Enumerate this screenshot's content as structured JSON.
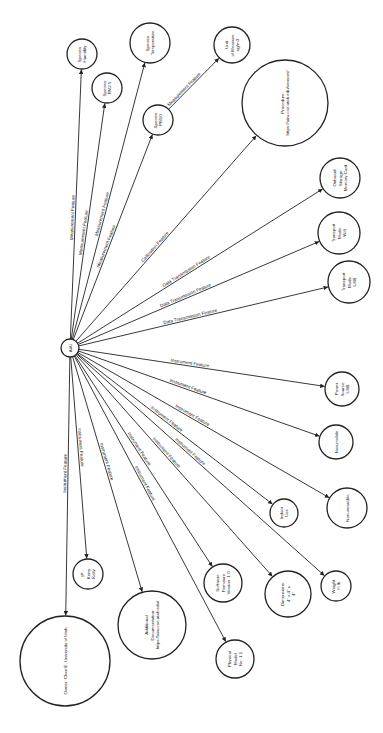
{
  "diagram": {
    "center": {
      "id": "airu",
      "label": "AirU",
      "x": 70,
      "y": 348,
      "r": 9
    },
    "nodes": [
      {
        "id": "species-humidity",
        "lines": [
          "Species:",
          "Humidity"
        ],
        "x": 82,
        "y": 54,
        "r": 15
      },
      {
        "id": "species-pm25",
        "lines": [
          "Species:",
          "PM2.5"
        ],
        "x": 107,
        "y": 88,
        "r": 15
      },
      {
        "id": "species-temperature",
        "lines": [
          "Species:",
          "Temperature"
        ],
        "x": 150,
        "y": 43,
        "r": 20
      },
      {
        "id": "species-pm10",
        "lines": [
          "Species:",
          "PM10"
        ],
        "x": 158,
        "y": 120,
        "r": 15
      },
      {
        "id": "unit-of-measure",
        "lines": [
          "Unit",
          "of Measure:",
          "ug/m3"
        ],
        "x": 232,
        "y": 45,
        "r": 18
      },
      {
        "id": "procedure",
        "lines": [
          "Procedure:",
          "https://airu.coe.utah.edu/sensors/"
        ],
        "x": 285,
        "y": 103,
        "r": 43
      },
      {
        "id": "onboard-storage",
        "lines": [
          "Onboard",
          "Storage:",
          "Memory Card"
        ],
        "x": 340,
        "y": 178,
        "r": 20
      },
      {
        "id": "transport-wifi",
        "lines": [
          "Transport",
          "Mode:",
          "Wifi"
        ],
        "x": 339,
        "y": 233,
        "r": 21
      },
      {
        "id": "transport-usb",
        "lines": [
          "Transport",
          "Mode:",
          "USB"
        ],
        "x": 349,
        "y": 282,
        "r": 21
      },
      {
        "id": "power-source",
        "lines": [
          "Power",
          "Source:",
          "USB"
        ],
        "x": 342,
        "y": 389,
        "r": 17
      },
      {
        "id": "non-mobile",
        "lines": [
          "Non-mobile"
        ],
        "x": 336,
        "y": 442,
        "r": 17
      },
      {
        "id": "non-wearable",
        "lines": [
          "Non-wearable"
        ],
        "x": 347,
        "y": 508,
        "r": 20
      },
      {
        "id": "indoor-use",
        "lines": [
          "Indoor",
          "Use"
        ],
        "x": 284,
        "y": 513,
        "r": 14
      },
      {
        "id": "weight",
        "lines": [
          "Weight:",
          "¼ lb"
        ],
        "x": 336,
        "y": 586,
        "r": 15
      },
      {
        "id": "dimensions",
        "lines": [
          "Dimensions:",
          "4\" x 4\" x",
          "4\""
        ],
        "x": 288,
        "y": 594,
        "r": 23
      },
      {
        "id": "software-firmware",
        "lines": [
          "Software",
          "Firmware",
          "Version: 1.0"
        ],
        "x": 223,
        "y": 583,
        "r": 19
      },
      {
        "id": "physical-model",
        "lines": [
          "Physical",
          "Model",
          "No: 1.1"
        ],
        "x": 235,
        "y": 659,
        "r": 19
      },
      {
        "id": "ip-kerry-kelly",
        "lines": [
          "IP:",
          "Kerry",
          "Kelly"
        ],
        "x": 88,
        "y": 574,
        "r": 15
      },
      {
        "id": "additional-documentation",
        "lines": [
          "Additional",
          "Documentation:",
          "https://airu.coe.utah.edu/"
        ],
        "x": 152,
        "y": 625,
        "r": 34
      },
      {
        "id": "owner",
        "lines": [
          "Owner: ChemE, University of Utah"
        ],
        "x": 65,
        "y": 661,
        "r": 45
      }
    ],
    "edges": [
      {
        "to": "species-humidity",
        "label": "Measurement Feature"
      },
      {
        "to": "species-pm25",
        "label": "Measurement Feature"
      },
      {
        "to": "species-temperature",
        "label": "Measurement Feature"
      },
      {
        "to": "species-pm10",
        "label": "Measurement Feature"
      },
      {
        "from": "species-pm10",
        "to": "unit-of-measure",
        "label": "Measurement Feature"
      },
      {
        "to": "procedure",
        "label": "Calibration Feature"
      },
      {
        "to": "onboard-storage",
        "label": "Data Transmission Feature"
      },
      {
        "to": "transport-wifi",
        "label": "Data Transmission Feature"
      },
      {
        "to": "transport-usb",
        "label": "Data Transmission Feature"
      },
      {
        "to": "power-source",
        "label": "Instrument Feature"
      },
      {
        "to": "non-mobile",
        "label": "Instrument Feature"
      },
      {
        "to": "non-wearable",
        "label": "Instrument Feature"
      },
      {
        "to": "indoor-use",
        "label": "Instrument Feature"
      },
      {
        "to": "weight",
        "label": "Instrument Feature"
      },
      {
        "to": "dimensions",
        "label": "Instrument Feature"
      },
      {
        "to": "software-firmware",
        "label": "Instrument Feature"
      },
      {
        "to": "physical-model",
        "label": "Instrument Feature"
      },
      {
        "to": "ip-kerry-kelly",
        "label": "Instrument Feature"
      },
      {
        "to": "additional-documentation",
        "label": "Instrument Feature"
      },
      {
        "to": "owner",
        "label": "Instrument Feature"
      }
    ]
  }
}
